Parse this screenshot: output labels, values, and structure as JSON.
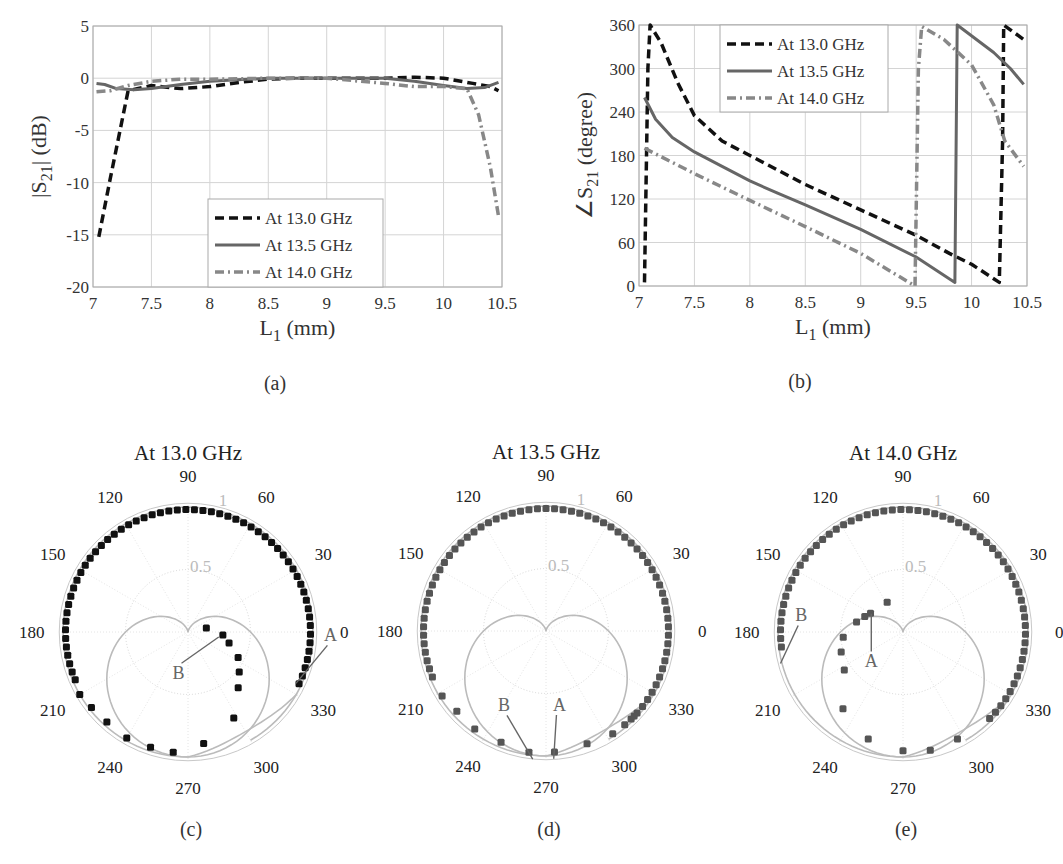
{
  "chart_data": [
    {
      "id": "a",
      "type": "line",
      "caption": "(a)",
      "xlabel": "L1 (mm)",
      "ylabel": "|S21| (dB)",
      "xlim": [
        7,
        10.5
      ],
      "ylim": [
        -20,
        5
      ],
      "xticks": [
        "7",
        "7.5",
        "8",
        "8.5",
        "9",
        "9.5",
        "10",
        "10.5"
      ],
      "yticks": [
        "5",
        "0",
        "-5",
        "-10",
        "-15",
        "-20"
      ],
      "grid": true,
      "legend_position": "lower center",
      "series": [
        {
          "name": "At 13.0 GHz",
          "style": "dashed",
          "color": "#111111",
          "x": [
            7.05,
            7.15,
            7.3,
            7.5,
            7.75,
            8.0,
            8.25,
            8.5,
            8.75,
            9.0,
            9.25,
            9.5,
            9.75,
            10.0,
            10.25,
            10.4,
            10.47
          ],
          "y": [
            -15.2,
            -9.5,
            -1.2,
            -0.7,
            -1.0,
            -0.8,
            -0.4,
            -0.1,
            0.0,
            0.0,
            0.0,
            0.0,
            0.1,
            0.0,
            -0.5,
            -0.8,
            -1.2
          ]
        },
        {
          "name": "At 13.5 GHz",
          "style": "solid",
          "color": "#666666",
          "x": [
            7.03,
            7.1,
            7.2,
            7.35,
            7.5,
            7.75,
            8.0,
            8.5,
            9.0,
            9.5,
            9.75,
            10.0,
            10.2,
            10.35,
            10.47
          ],
          "y": [
            -0.5,
            -0.6,
            -1.0,
            -1.1,
            -1.0,
            -0.6,
            -0.3,
            0.0,
            0.0,
            0.0,
            -0.3,
            -0.7,
            -1.0,
            -0.9,
            -0.4
          ]
        },
        {
          "name": "At 14.0 GHz",
          "style": "dashdot",
          "color": "#888888",
          "x": [
            7.03,
            7.15,
            7.3,
            7.5,
            7.75,
            8.0,
            8.5,
            9.0,
            9.5,
            9.75,
            10.0,
            10.2,
            10.3,
            10.4,
            10.47
          ],
          "y": [
            -1.3,
            -1.2,
            -0.7,
            -0.3,
            -0.1,
            -0.1,
            0.0,
            0.0,
            -0.5,
            -0.8,
            -0.8,
            -1.0,
            -3.5,
            -8.5,
            -13.2
          ]
        }
      ]
    },
    {
      "id": "b",
      "type": "line",
      "caption": "(b)",
      "xlabel": "L1 (mm)",
      "ylabel": "∠S21 (degree)",
      "xlim": [
        7,
        10.5
      ],
      "ylim": [
        0,
        360
      ],
      "xticks": [
        "7",
        "7.5",
        "8",
        "8.5",
        "9",
        "9.5",
        "10",
        "10.5"
      ],
      "yticks": [
        "360",
        "300",
        "240",
        "180",
        "120",
        "60",
        "0"
      ],
      "grid": true,
      "legend_position": "upper center",
      "series": [
        {
          "name": "At 13.0 GHz",
          "style": "dashed",
          "color": "#111111",
          "x": [
            7.05,
            7.08,
            7.1,
            7.2,
            7.35,
            7.5,
            7.75,
            8.0,
            8.5,
            9.0,
            9.5,
            9.8,
            10.0,
            10.25,
            10.28,
            10.29,
            10.47
          ],
          "y": [
            5,
            300,
            360,
            335,
            280,
            235,
            200,
            180,
            140,
            105,
            70,
            45,
            30,
            5,
            200,
            360,
            340
          ]
        },
        {
          "name": "At 13.5 GHz",
          "style": "solid",
          "color": "#666666",
          "x": [
            7.05,
            7.15,
            7.3,
            7.5,
            7.75,
            8.0,
            8.25,
            8.5,
            9.0,
            9.5,
            9.85,
            9.87,
            10.2,
            10.35,
            10.47
          ],
          "y": [
            260,
            230,
            205,
            185,
            165,
            145,
            128,
            112,
            78,
            40,
            5,
            360,
            322,
            300,
            278
          ]
        },
        {
          "name": "At 14.0 GHz",
          "style": "dashdot",
          "color": "#888888",
          "x": [
            7.05,
            7.5,
            8.0,
            8.5,
            9.0,
            9.49,
            9.52,
            9.55,
            9.75,
            10.0,
            10.2,
            10.3,
            10.47
          ],
          "y": [
            190,
            155,
            118,
            82,
            45,
            0,
            300,
            358,
            340,
            305,
            250,
            200,
            165
          ]
        }
      ]
    },
    {
      "id": "c",
      "type": "polar",
      "title": "At 13.0 GHz",
      "caption": "(c)",
      "angle_ticks": [
        "0",
        "30",
        "60",
        "90",
        "120",
        "150",
        "180",
        "210",
        "240",
        "270",
        "300",
        "330"
      ],
      "radial_ticks": [
        "0.5",
        "1"
      ],
      "marker_color": "#111111",
      "annotations": [
        {
          "label": "A",
          "point_angle": 338,
          "point_r": 0.97
        },
        {
          "label": "B",
          "point_angle": 338,
          "point_r": 0.22
        }
      ]
    },
    {
      "id": "d",
      "type": "polar",
      "title": "At 13.5 GHz",
      "caption": "(d)",
      "angle_ticks": [
        "0",
        "30",
        "60",
        "90",
        "120",
        "150",
        "180",
        "210",
        "240",
        "270",
        "300",
        "330"
      ],
      "radial_ticks": [
        "0.5",
        "1"
      ],
      "marker_color": "#555555",
      "annotations": [
        {
          "label": "A",
          "point_angle": 274,
          "point_r": 0.97
        },
        {
          "label": "B",
          "point_angle": 262,
          "point_r": 0.98
        }
      ]
    },
    {
      "id": "e",
      "type": "polar",
      "title": "At 14.0 GHz",
      "caption": "(e)",
      "angle_ticks": [
        "0",
        "30",
        "60",
        "90",
        "120",
        "150",
        "180",
        "210",
        "240",
        "270",
        "300",
        "330"
      ],
      "radial_ticks": [
        "0.5",
        "1"
      ],
      "marker_color": "#555555",
      "annotations": [
        {
          "label": "A",
          "point_angle": 160,
          "point_r": 0.27
        },
        {
          "label": "B",
          "point_angle": 192,
          "point_r": 0.98
        }
      ]
    }
  ]
}
